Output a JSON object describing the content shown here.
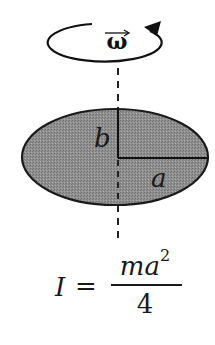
{
  "diagram": {
    "rotation": {
      "symbol": "ω",
      "vector_notation": true,
      "direction": "counterclockwise",
      "icon": "rotation-arrow-icon"
    },
    "axis": {
      "style": "dashed",
      "orientation": "vertical"
    },
    "shape": {
      "type": "ellipse",
      "fill": "#8c8c8c",
      "stroke": "#1a1a1a"
    },
    "labels": {
      "semi_minor": "b",
      "semi_major": "a"
    },
    "formula": {
      "lhs": "I",
      "equals": "=",
      "numerator": "ma",
      "exponent": "2",
      "denominator": "4"
    }
  }
}
